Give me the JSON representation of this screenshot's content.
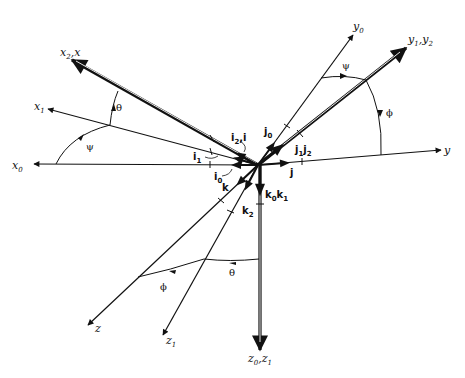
{
  "figure": {
    "origin": [
      258,
      165
    ]
  },
  "axes": {
    "x0": {
      "label": "x",
      "sub": "0"
    },
    "x1": {
      "label": "x",
      "sub": "1"
    },
    "x2x": {
      "label": "x",
      "sub": "2",
      "extra": ",x"
    },
    "y0": {
      "label": "y",
      "sub": "0"
    },
    "y1y2": {
      "label": "y",
      "sub": "1",
      "extra": ",y",
      "sub2": "2"
    },
    "y": {
      "label": "y"
    },
    "z": {
      "label": "z"
    },
    "z1": {
      "label": "z",
      "sub": "1"
    },
    "z0z1": {
      "label": "z",
      "sub": "0",
      "extra": ",z",
      "sub2": "1"
    }
  },
  "unit_vectors": {
    "i0": {
      "label": "i",
      "sub": "0"
    },
    "i1": {
      "label": "i",
      "sub": "1"
    },
    "i2i": {
      "label": "i",
      "sub": "2",
      "extra": ",i"
    },
    "j0": {
      "label": "j",
      "sub": "0"
    },
    "j1j2": {
      "label": "j",
      "sub": "1",
      "extra": "j",
      "sub2": "2"
    },
    "j": {
      "label": "j"
    },
    "k": {
      "label": "k"
    },
    "k2": {
      "label": "k",
      "sub": "2"
    },
    "k0k1": {
      "label": "k",
      "sub": "0",
      "extra": "k",
      "sub2": "1"
    }
  },
  "angles": {
    "psi_left": "ψ",
    "theta_left": "θ",
    "psi_right": "ψ",
    "phi_right": "ϕ",
    "theta_bottom": "θ",
    "phi_bottom": "ϕ"
  },
  "colors": {
    "stroke": "#111111",
    "background": "#ffffff"
  }
}
